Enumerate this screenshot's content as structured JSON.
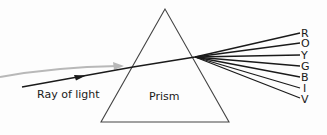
{
  "diagram": {
    "labels": {
      "ray": "Ray of light",
      "prism": "Prism"
    },
    "spectrum": [
      {
        "letter": "R",
        "y": 33
      },
      {
        "letter": "O",
        "y": 43
      },
      {
        "letter": "Y",
        "y": 55
      },
      {
        "letter": "G",
        "y": 66
      },
      {
        "letter": "B",
        "y": 77
      },
      {
        "letter": "I",
        "y": 88
      },
      {
        "letter": "V",
        "y": 98
      }
    ],
    "colors": {
      "line": "#1a1a1a",
      "incident_gray": "#b8b8b8",
      "prism_outline": "#444444",
      "background": "#fdfdfd"
    }
  }
}
